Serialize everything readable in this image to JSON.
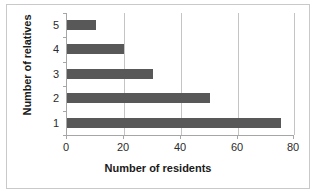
{
  "clipped_top_text": "",
  "chart_data": {
    "type": "bar",
    "orientation": "horizontal",
    "title": "",
    "xlabel": "Number of residents",
    "ylabel": "Number of relatives",
    "categories": [
      "5",
      "4",
      "3",
      "2",
      "1"
    ],
    "values": [
      10,
      20,
      30,
      50,
      75
    ],
    "xlim": [
      0,
      80
    ],
    "xticks": [
      "0",
      "20",
      "40",
      "60",
      "80"
    ],
    "xtick_values": [
      0,
      20,
      40,
      60,
      80
    ],
    "grid": "vertical",
    "legend": "none",
    "bar_color": "#585858",
    "gridline_color": "#c4c4c4",
    "axis_color": "#a6a6a6",
    "background_color": "#ffffff"
  }
}
